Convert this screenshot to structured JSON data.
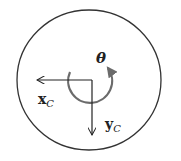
{
  "diagram": {
    "type": "camera-frame-rotation",
    "labels": {
      "theta": "θ",
      "x_axis": "x",
      "x_sub": "C",
      "y_axis": "y",
      "y_sub": "C"
    },
    "colors": {
      "outline": "#333333",
      "axes": "#222222",
      "rotation_arrow": "#6b6b6b",
      "background": "#ffffff"
    }
  }
}
